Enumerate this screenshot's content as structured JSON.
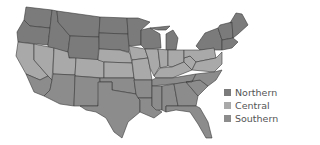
{
  "map": {
    "region": "United States",
    "regions": [
      {
        "name": "Northern",
        "color": "#7b7b7b"
      },
      {
        "name": "Central",
        "color": "#a9a9a9"
      },
      {
        "name": "Southern",
        "color": "#8c8c8c"
      }
    ]
  },
  "legend": {
    "items": [
      {
        "label": "Northern",
        "color": "#7b7b7b"
      },
      {
        "label": "Central",
        "color": "#a9a9a9"
      },
      {
        "label": "Southern",
        "color": "#8c8c8c"
      }
    ]
  }
}
